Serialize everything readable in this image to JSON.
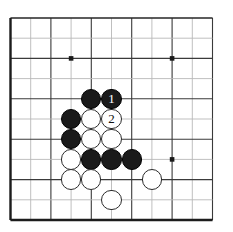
{
  "diagram": {
    "board": {
      "kind": "go-board",
      "visible_columns": 11,
      "visible_rows": 11,
      "cell_size": 20.2,
      "origin_x": 10.5,
      "origin_y": 18.0,
      "background_color": "#ffffff",
      "grid_color_major": "#3a3a3a",
      "grid_color_minor": "#b8b8b8",
      "border_color": "#1c1c1c",
      "star_point_color": "#1a1a1a",
      "stone_radius": 10.2
    },
    "star_points": [
      {
        "name": "star-point-upper-left",
        "col": 3,
        "row": 2
      },
      {
        "name": "star-point-upper-right",
        "col": 8,
        "row": 2
      },
      {
        "name": "star-point-lower-right",
        "col": 8,
        "row": 7
      }
    ],
    "stones": [
      {
        "id": "black-stone-c4r4",
        "color": "black",
        "col": 4,
        "row": 4,
        "label": ""
      },
      {
        "id": "black-stone-move-1",
        "color": "black",
        "col": 5,
        "row": 4,
        "label": "1"
      },
      {
        "id": "black-stone-c3r5",
        "color": "black",
        "col": 3,
        "row": 5,
        "label": ""
      },
      {
        "id": "white-stone-c4r5",
        "color": "white",
        "col": 4,
        "row": 5,
        "label": ""
      },
      {
        "id": "white-stone-move-2",
        "color": "white",
        "col": 5,
        "row": 5,
        "label": "2"
      },
      {
        "id": "black-stone-c3r6",
        "color": "black",
        "col": 3,
        "row": 6,
        "label": ""
      },
      {
        "id": "white-stone-c4r6",
        "color": "white",
        "col": 4,
        "row": 6,
        "label": ""
      },
      {
        "id": "white-stone-c5r6",
        "color": "white",
        "col": 5,
        "row": 6,
        "label": ""
      },
      {
        "id": "white-stone-c3r7",
        "color": "white",
        "col": 3,
        "row": 7,
        "label": ""
      },
      {
        "id": "black-stone-c4r7",
        "color": "black",
        "col": 4,
        "row": 7,
        "label": ""
      },
      {
        "id": "black-stone-c5r7",
        "color": "black",
        "col": 5,
        "row": 7,
        "label": ""
      },
      {
        "id": "black-stone-c6r7",
        "color": "black",
        "col": 6,
        "row": 7,
        "label": ""
      },
      {
        "id": "white-stone-c3r8",
        "color": "white",
        "col": 3,
        "row": 8,
        "label": ""
      },
      {
        "id": "white-stone-c4r8",
        "color": "white",
        "col": 4,
        "row": 8,
        "label": ""
      },
      {
        "id": "white-stone-c7r8",
        "color": "white",
        "col": 7,
        "row": 8,
        "label": ""
      },
      {
        "id": "white-stone-c5r9",
        "color": "white",
        "col": 5,
        "row": 9,
        "label": ""
      }
    ],
    "move_sequence": [
      {
        "number": "1",
        "color": "black"
      },
      {
        "number": "2",
        "color": "white"
      }
    ]
  }
}
